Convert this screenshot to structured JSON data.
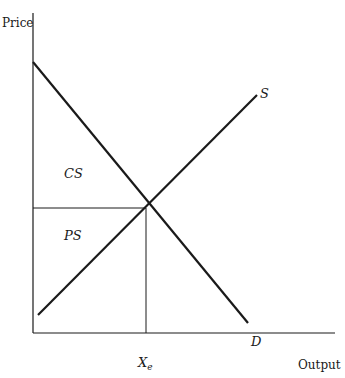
{
  "diagram": {
    "type": "supply-demand-surplus",
    "axes": {
      "y_label": "Price",
      "x_label": "Output"
    },
    "curves": [
      {
        "name": "S",
        "label": "S",
        "kind": "supply",
        "from": [
          38,
          315
        ],
        "to": [
          257,
          95
        ]
      },
      {
        "name": "D",
        "label": "D",
        "kind": "demand",
        "from": [
          33,
          62
        ],
        "to": [
          248,
          323
        ]
      }
    ],
    "equilibrium": {
      "point": [
        146,
        208
      ],
      "x_label_main": "X",
      "x_label_sub": "e"
    },
    "regions": [
      {
        "name": "consumer-surplus",
        "label": "CS"
      },
      {
        "name": "producer-surplus",
        "label": "PS"
      }
    ],
    "colors": {
      "line": "#1a1a1a",
      "background": "#ffffff"
    }
  }
}
